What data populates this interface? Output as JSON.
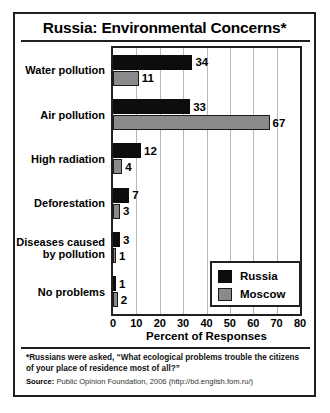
{
  "chart_data": {
    "type": "bar",
    "orientation": "horizontal",
    "title": "Russia: Environmental Concerns*",
    "xlabel": "Percent of Responses",
    "ylabel": "",
    "xlim": [
      0,
      80
    ],
    "xticks": [
      0,
      10,
      20,
      30,
      40,
      50,
      60,
      70,
      80
    ],
    "grid": true,
    "legend_position": "lower-right",
    "categories": [
      "Water pollution",
      "Air pollution",
      "High radiation",
      "Deforestation",
      "Diseases caused\nby pollution",
      "No problems"
    ],
    "series": [
      {
        "name": "Russia",
        "color": "#0d0d0d",
        "values": [
          34,
          33,
          12,
          7,
          3,
          1
        ]
      },
      {
        "name": "Moscow",
        "color": "#8a8a8a",
        "values": [
          11,
          67,
          4,
          3,
          1,
          2
        ]
      }
    ]
  },
  "footnote": "*Russians were asked, “What ecological problems trouble the citizens of your place of residence most of all?”",
  "source": {
    "label": "Source:",
    "text": "Public Opinion Foundation, 2006 (http://bd.english.fom.ru/)"
  }
}
